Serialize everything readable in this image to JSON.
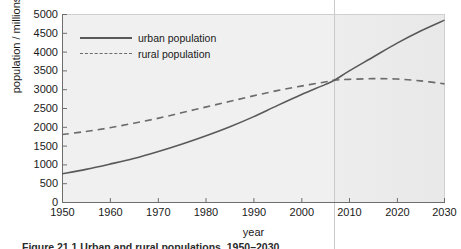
{
  "chart_data": {
    "type": "line",
    "title": "",
    "xlabel": "year",
    "ylabel": "population / millions",
    "xlim": [
      1950,
      2030
    ],
    "ylim": [
      0,
      5000
    ],
    "grid": false,
    "legend_position": "upper-left-inside",
    "xticks": [
      "1950",
      "1960",
      "1970",
      "1980",
      "1990",
      "2000",
      "2010",
      "2020",
      "2030"
    ],
    "yticks": [
      "5000",
      "4500",
      "4000",
      "3500",
      "3000",
      "2500",
      "2000",
      "1500",
      "1000",
      "500",
      "0"
    ],
    "x": [
      1950,
      1955,
      1960,
      1965,
      1970,
      1975,
      1980,
      1985,
      1990,
      1995,
      2000,
      2005,
      2007,
      2010,
      2015,
      2020,
      2025,
      2030
    ],
    "series": [
      {
        "name": "urban population",
        "style": "solid",
        "color": "#595959",
        "values": [
          750,
          870,
          1010,
          1160,
          1340,
          1540,
          1760,
          2000,
          2270,
          2570,
          2860,
          3130,
          3250,
          3490,
          3860,
          4230,
          4560,
          4850
        ]
      },
      {
        "name": "rural population",
        "style": "dashed",
        "color": "#6b6b6b",
        "values": [
          1800,
          1880,
          1980,
          2100,
          2230,
          2380,
          2530,
          2680,
          2830,
          2970,
          3090,
          3200,
          3250,
          3270,
          3290,
          3280,
          3230,
          3150
        ]
      }
    ],
    "annotations": [
      {
        "name": "crossover-marker",
        "type": "vline",
        "x": 2007,
        "y": 3250,
        "note": "urban and rural populations cross"
      }
    ],
    "colors": {
      "plot_background": "#f0f0f0",
      "page_background": "#ffffff",
      "axis": "#6e6e6e",
      "text": "#1a1a1a",
      "urban_line": "#595959",
      "rural_line": "#6b6b6b",
      "marker_line": "#c9c9c9"
    }
  },
  "legend": {
    "items": [
      {
        "label": "urban population",
        "key": "solid-line-key"
      },
      {
        "label": "rural population",
        "key": "dashed-line-key"
      }
    ]
  },
  "caption": {
    "text": "Figure 21.1   Urban and rural populations, 1950–2030"
  }
}
